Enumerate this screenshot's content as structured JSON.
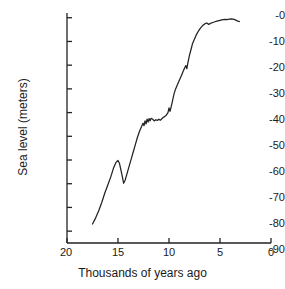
{
  "chart_data": {
    "type": "line",
    "title": "",
    "xlabel": "Thousands of years ago",
    "ylabel": "Sea level (meters)",
    "xlim": [
      20,
      0
    ],
    "ylim": [
      -95,
      2
    ],
    "grid": false,
    "legend": null,
    "x_ticks": [
      "20",
      "15",
      "10",
      "5",
      "0"
    ],
    "x_tick_values": [
      20,
      15,
      10,
      5,
      0
    ],
    "y_ticks": [
      "-0",
      "-10",
      "-20",
      "-30",
      "-40",
      "-50",
      "-60",
      "-70",
      "-80",
      "-90"
    ],
    "y_tick_values": [
      0,
      -10,
      -20,
      -30,
      -40,
      -50,
      -60,
      -70,
      -80,
      -90
    ],
    "x_axis_reversed": true,
    "series": [
      {
        "name": "Sea level",
        "color": "#222222",
        "x": [
          17.5,
          17.2,
          16.9,
          16.6,
          16.3,
          16.0,
          15.7,
          15.45,
          15.2,
          15.0,
          14.85,
          14.7,
          14.55,
          14.45,
          14.3,
          14.1,
          13.9,
          13.7,
          13.5,
          13.3,
          13.1,
          12.9,
          12.7,
          12.55,
          12.45,
          12.35,
          12.25,
          12.15,
          12.05,
          11.95,
          11.85,
          11.75,
          11.6,
          11.45,
          11.3,
          11.15,
          11.0,
          10.85,
          10.7,
          10.55,
          10.4,
          10.25,
          10.1,
          10.0,
          9.9,
          9.8,
          9.65,
          9.5,
          9.35,
          9.2,
          9.05,
          8.9,
          8.75,
          8.6,
          8.45,
          8.35,
          8.25,
          8.15,
          8.0,
          7.85,
          7.7,
          7.5,
          7.3,
          7.1,
          6.9,
          6.7,
          6.5,
          6.3,
          6.1,
          5.9,
          5.7,
          5.5,
          5.3,
          5.1,
          4.9,
          4.7,
          4.5,
          4.3,
          4.1,
          3.9,
          3.7,
          3.5,
          3.3,
          3.1
        ],
        "y": [
          -87.0,
          -84.5,
          -81.5,
          -78.0,
          -74.0,
          -70.5,
          -67.0,
          -63.5,
          -61.0,
          -60.2,
          -61.5,
          -64.5,
          -67.5,
          -69.8,
          -68.5,
          -65.5,
          -62.5,
          -59.5,
          -56.5,
          -53.5,
          -50.5,
          -48.0,
          -46.0,
          -44.5,
          -45.5,
          -43.5,
          -44.8,
          -42.8,
          -44.0,
          -42.5,
          -43.5,
          -42.4,
          -42.8,
          -43.5,
          -43.0,
          -43.3,
          -42.8,
          -43.2,
          -42.6,
          -42.0,
          -41.6,
          -41.0,
          -40.0,
          -38.0,
          -39.5,
          -37.8,
          -35.0,
          -32.0,
          -30.0,
          -28.5,
          -27.0,
          -25.5,
          -24.0,
          -22.5,
          -21.0,
          -20.2,
          -21.5,
          -19.0,
          -16.0,
          -13.5,
          -11.0,
          -9.0,
          -7.0,
          -5.5,
          -4.3,
          -3.3,
          -2.6,
          -2.2,
          -2.8,
          -2.3,
          -2.0,
          -1.7,
          -1.4,
          -1.2,
          -1.0,
          -0.8,
          -0.7,
          -0.8,
          -0.6,
          -0.5,
          -0.6,
          -0.9,
          -1.3,
          -1.6
        ]
      }
    ]
  },
  "axes": {
    "y_axis_name": "sea-level-axis",
    "x_axis_name": "time-axis"
  }
}
